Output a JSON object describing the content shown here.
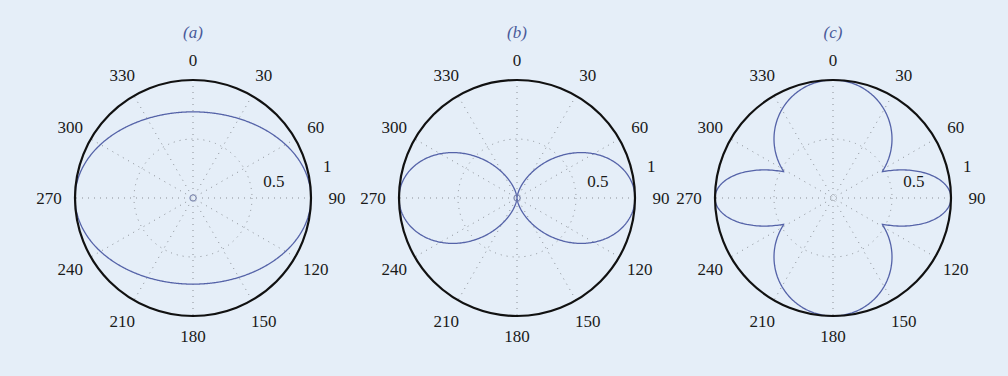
{
  "figure": {
    "background": "#e5eef8",
    "curve_color": "#5563a8",
    "axis_color": "#111111"
  },
  "chart_data": [
    {
      "type": "polar",
      "panel_label": "(a)",
      "title": "",
      "center": [
        193,
        198
      ],
      "radius_px": 118,
      "angular_ticks": [
        "0",
        "30",
        "60",
        "90",
        "120",
        "150",
        "180",
        "210",
        "240",
        "270",
        "300",
        "330"
      ],
      "angular_direction": "clockwise from top",
      "radial_ticks": [
        "0.5",
        "1"
      ],
      "rlim": [
        0,
        1
      ],
      "grid": true,
      "center_marker": true,
      "series": [
        {
          "name": "pattern-a",
          "description": "Ellipse-like pattern: r=1 at 90/270, r~0.73 at 0/180",
          "formula": "ellipse",
          "params": {
            "a_h": 1.0,
            "a_v": 0.73
          },
          "samples": {
            "theta_deg": [
              0,
              30,
              60,
              90,
              120,
              150,
              180,
              210,
              240,
              270,
              300,
              330
            ],
            "r": [
              0.73,
              0.79,
              0.93,
              1.0,
              0.93,
              0.79,
              0.73,
              0.79,
              0.93,
              1.0,
              0.93,
              0.79
            ]
          }
        }
      ]
    },
    {
      "type": "polar",
      "panel_label": "(b)",
      "title": "",
      "center": [
        517,
        198
      ],
      "radius_px": 118,
      "angular_ticks": [
        "0",
        "30",
        "60",
        "90",
        "120",
        "150",
        "180",
        "210",
        "240",
        "270",
        "300",
        "330"
      ],
      "angular_direction": "clockwise from top",
      "radial_ticks": [
        "0.5",
        "1"
      ],
      "rlim": [
        0,
        1
      ],
      "grid": true,
      "center_marker": true,
      "series": [
        {
          "name": "pattern-b",
          "description": "Figure-eight (two lobes along 90/270), r = sin^2(theta)",
          "formula": "sin_pow",
          "params": {
            "n": 2
          },
          "samples": {
            "theta_deg": [
              0,
              30,
              60,
              90,
              120,
              150,
              180,
              210,
              240,
              270,
              300,
              330
            ],
            "r": [
              0.0,
              0.25,
              0.75,
              1.0,
              0.75,
              0.25,
              0.0,
              0.25,
              0.75,
              1.0,
              0.75,
              0.25
            ]
          }
        }
      ]
    },
    {
      "type": "polar",
      "panel_label": "(c)",
      "title": "",
      "center": [
        833,
        198
      ],
      "radius_px": 118,
      "angular_ticks": [
        "0",
        "30",
        "60",
        "90",
        "120",
        "150",
        "180",
        "210",
        "240",
        "270",
        "300",
        "330"
      ],
      "angular_direction": "clockwise from top",
      "radial_ticks": [
        "0.5",
        "1"
      ],
      "rlim": [
        0,
        1
      ],
      "grid": true,
      "center_marker": false,
      "series": [
        {
          "name": "pattern-c",
          "description": "Four lobes: wide lobes along 0/180 (r=|cos theta|), narrow lobes along 90/270 (r=|sin theta|^6)",
          "formula": "four_lobe",
          "params": {
            "v_pow": 1,
            "h_pow": 6
          },
          "samples": {
            "theta_deg": [
              0,
              30,
              60,
              90,
              120,
              150,
              180,
              210,
              240,
              270,
              300,
              330
            ],
            "r": [
              1.0,
              0.87,
              0.5,
              1.0,
              0.5,
              0.87,
              1.0,
              0.87,
              0.5,
              1.0,
              0.5,
              0.87
            ]
          }
        }
      ]
    }
  ]
}
